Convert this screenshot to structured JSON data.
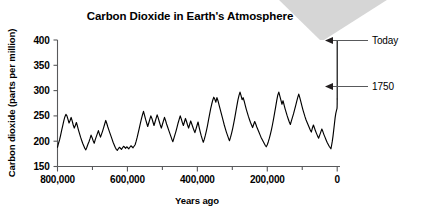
{
  "chart_data": {
    "type": "line",
    "title": "Carbon Dioxide in Earth's Atmosphere",
    "xlabel": "Years ago",
    "ylabel": "Carbon dioxide (parts per million)",
    "xlim": [
      800000,
      -8000
    ],
    "ylim": [
      150,
      400
    ],
    "x_reversed": true,
    "grid": false,
    "legend": null,
    "x_ticks": [
      800000,
      700000,
      600000,
      500000,
      400000,
      300000,
      200000,
      100000,
      0
    ],
    "x_tick_labels": [
      "800,000",
      "",
      "600,000",
      "",
      "400,000",
      "",
      "200,000",
      "",
      "0"
    ],
    "y_ticks": [
      150,
      200,
      250,
      300,
      350,
      400
    ],
    "y_tick_labels": [
      "150",
      "200",
      "250",
      "300",
      "350",
      "400"
    ],
    "annotations": [
      {
        "label": "Today",
        "value_ppm": 400,
        "years_ago": 0
      },
      {
        "label": "1750",
        "value_ppm": 300,
        "years_ago": 0
      }
    ],
    "series": [
      {
        "name": "Ice core CO2 record",
        "x": [
          800000,
          797000,
          794000,
          791000,
          788000,
          785000,
          782000,
          779000,
          776000,
          773000,
          770000,
          767000,
          764000,
          761000,
          758000,
          755000,
          752000,
          749000,
          746000,
          743000,
          740000,
          737000,
          734000,
          731000,
          728000,
          725000,
          722000,
          719000,
          716000,
          713000,
          710000,
          707000,
          704000,
          701000,
          698000,
          695000,
          692000,
          689000,
          686000,
          683000,
          680000,
          677000,
          674000,
          671000,
          668000,
          665000,
          662000,
          659000,
          656000,
          653000,
          650000,
          647000,
          644000,
          641000,
          638000,
          635000,
          632000,
          629000,
          626000,
          623000,
          620000,
          617000,
          614000,
          611000,
          608000,
          605000,
          602000,
          599000,
          596000,
          593000,
          590000,
          587000,
          584000,
          581000,
          578000,
          575000,
          572000,
          569000,
          566000,
          563000,
          560000,
          557000,
          554000,
          551000,
          548000,
          545000,
          542000,
          539000,
          536000,
          533000,
          530000,
          527000,
          524000,
          521000,
          518000,
          515000,
          512000,
          509000,
          506000,
          503000,
          500000,
          497000,
          494000,
          491000,
          488000,
          485000,
          482000,
          479000,
          476000,
          473000,
          470000,
          467000,
          464000,
          461000,
          458000,
          455000,
          452000,
          449000,
          446000,
          443000,
          440000,
          437000,
          434000,
          431000,
          428000,
          425000,
          422000,
          419000,
          416000,
          413000,
          410000,
          407000,
          404000,
          401000,
          398000,
          395000,
          392000,
          389000,
          386000,
          383000,
          380000,
          377000,
          374000,
          371000,
          368000,
          365000,
          362000,
          359000,
          356000,
          353000,
          350000,
          347000,
          344000,
          341000,
          338000,
          335000,
          332000,
          329000,
          326000,
          323000,
          320000,
          317000,
          314000,
          311000,
          308000,
          305000,
          302000,
          299000,
          296000,
          293000,
          290000,
          287000,
          284000,
          281000,
          278000,
          275000,
          272000,
          269000,
          266000,
          263000,
          260000,
          257000,
          254000,
          251000,
          248000,
          245000,
          242000,
          239000,
          236000,
          233000,
          230000,
          227000,
          224000,
          221000,
          218000,
          215000,
          212000,
          209000,
          206000,
          203000,
          200000,
          197000,
          194000,
          191000,
          188000,
          185000,
          182000,
          179000,
          176000,
          173000,
          170000,
          167000,
          164000,
          161000,
          158000,
          155000,
          152000,
          149000,
          146000,
          143000,
          140000,
          137000,
          134000,
          131000,
          128000,
          125000,
          122000,
          119000,
          116000,
          113000,
          110000,
          107000,
          104000,
          101000,
          98000,
          95000,
          92000,
          89000,
          86000,
          83000,
          80000,
          77000,
          74000,
          71000,
          68000,
          65000,
          62000,
          59000,
          56000,
          53000,
          50000,
          47000,
          44000,
          41000,
          38000,
          35000,
          32000,
          29000,
          26000,
          23000,
          20000,
          18000,
          16000,
          14000,
          12000,
          10000,
          8000,
          6000,
          4000,
          2000,
          500,
          260,
          150,
          60,
          0
        ],
        "y": [
          188,
          196,
          203,
          212,
          222,
          231,
          240,
          248,
          253,
          250,
          243,
          236,
          241,
          247,
          240,
          232,
          226,
          231,
          237,
          230,
          222,
          215,
          208,
          202,
          196,
          191,
          186,
          183,
          188,
          194,
          199,
          205,
          212,
          207,
          201,
          196,
          203,
          209,
          215,
          221,
          214,
          208,
          214,
          220,
          227,
          234,
          241,
          235,
          228,
          222,
          216,
          210,
          204,
          198,
          193,
          188,
          184,
          182,
          185,
          188,
          186,
          184,
          187,
          190,
          188,
          186,
          189,
          187,
          185,
          188,
          191,
          189,
          187,
          190,
          193,
          200,
          208,
          217,
          226,
          235,
          244,
          252,
          259,
          251,
          243,
          236,
          229,
          236,
          243,
          250,
          245,
          238,
          231,
          238,
          245,
          252,
          246,
          239,
          232,
          226,
          233,
          240,
          247,
          241,
          234,
          228,
          222,
          216,
          210,
          204,
          199,
          206,
          213,
          220,
          228,
          236,
          243,
          250,
          244,
          237,
          231,
          238,
          245,
          239,
          232,
          226,
          233,
          240,
          234,
          228,
          222,
          217,
          224,
          231,
          238,
          228,
          219,
          211,
          204,
          198,
          204,
          212,
          221,
          231,
          242,
          253,
          264,
          273,
          281,
          287,
          283,
          277,
          286,
          280,
          272,
          264,
          256,
          248,
          240,
          232,
          225,
          218,
          212,
          206,
          201,
          208,
          216,
          225,
          235,
          246,
          258,
          270,
          281,
          290,
          297,
          290,
          282,
          286,
          279,
          271,
          263,
          256,
          249,
          243,
          237,
          232,
          227,
          233,
          239,
          234,
          228,
          223,
          218,
          213,
          208,
          204,
          200,
          196,
          192,
          189,
          193,
          199,
          206,
          214,
          223,
          233,
          244,
          256,
          268,
          280,
          291,
          297,
          289,
          281,
          273,
          280,
          272,
          264,
          257,
          250,
          244,
          238,
          233,
          240,
          247,
          254,
          262,
          270,
          278,
          286,
          293,
          286,
          278,
          270,
          262,
          255,
          248,
          242,
          237,
          232,
          227,
          222,
          218,
          226,
          232,
          226,
          220,
          215,
          210,
          206,
          212,
          218,
          224,
          219,
          213,
          208,
          203,
          198,
          194,
          190,
          187,
          185,
          192,
          200,
          210,
          222,
          234,
          246,
          255,
          261,
          265,
          268,
          272,
          278,
          283
        ]
      }
    ],
    "modern_spike": {
      "name": "Industrial era rise",
      "from_ppm": 283,
      "to_ppm": 400,
      "years_ago": 0
    }
  }
}
